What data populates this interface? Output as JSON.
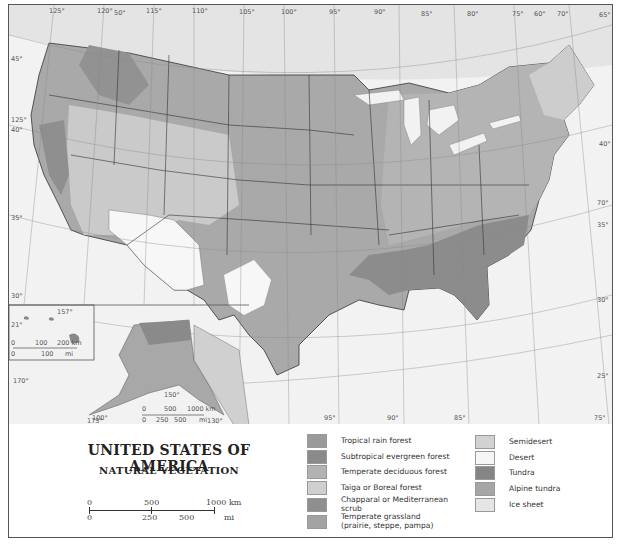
{
  "title": "UNITED STATES OF AMERICA",
  "subtitle": "NATURAL VEGETATION",
  "scale_bar": {
    "km_labels": [
      "0",
      "500",
      "1000 km"
    ],
    "mi_labels": [
      "0",
      "250",
      "500",
      "mi"
    ]
  },
  "inset_hawaii_scale": {
    "km_labels": [
      "0",
      "100",
      "200 km"
    ],
    "mi_labels": [
      "0",
      "100",
      "mi"
    ]
  },
  "inset_alaska_scale": {
    "km_labels": [
      "0",
      "500",
      "1000 km"
    ],
    "mi_labels": [
      "0",
      "250",
      "500",
      "mi"
    ]
  },
  "legend": {
    "left_column": [
      {
        "label": "Tropical rain forest",
        "color": "#9a9a9a"
      },
      {
        "label": "Subtropical evergreen forest",
        "color": "#8a8a8a"
      },
      {
        "label": "Temperate deciduous forest",
        "color": "#b3b3b3"
      },
      {
        "label": "Taiga or Boreal forest",
        "color": "#cfcfcf"
      },
      {
        "label": "Chapparal or Mediterranean scrub",
        "color": "#8f8f8f"
      },
      {
        "label": "Temperate grassland (prairie, steppe, pampa)",
        "color": "#a3a3a3"
      }
    ],
    "right_column": [
      {
        "label": "Semidesert",
        "color": "#d2d2d2"
      },
      {
        "label": "Desert",
        "color": "#f6f6f6"
      },
      {
        "label": "Tundra",
        "color": "#858585"
      },
      {
        "label": "Alpine tundra",
        "color": "#a6a6a6"
      },
      {
        "label": "Ice sheet",
        "color": "#e6e6e6"
      }
    ]
  },
  "graticule": {
    "top_longitudes": [
      "125°",
      "120°",
      "115°",
      "110°",
      "105°",
      "100°",
      "95°",
      "90°",
      "85°",
      "80°",
      "75°",
      "70°",
      "65°"
    ],
    "top_extra": [
      "50°"
    ],
    "bottom_longitudes": [
      "100°",
      "95°",
      "90°",
      "85°",
      "75°"
    ],
    "left_latitudes": [
      "45°",
      "40°",
      "35°",
      "30°"
    ],
    "right_latitudes": [
      "45°",
      "40°",
      "35°",
      "30°",
      "25°"
    ],
    "misc": [
      "125°",
      "120°",
      "115°",
      "110°",
      "105°",
      "70°",
      "25°",
      "21°",
      "157°",
      "170°",
      "175°",
      "150°",
      "130°",
      "120°"
    ]
  }
}
